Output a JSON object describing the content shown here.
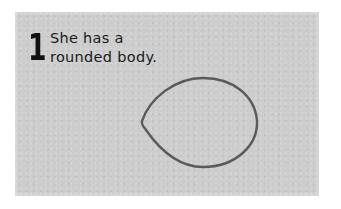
{
  "card": {
    "step_number": "1",
    "caption_line1": "She has a",
    "caption_line2": "rounded body.",
    "background_color": "#cdcdcd",
    "outline_color": "#5a5a5a",
    "shape": "lemon-shaped-oval-outline"
  }
}
